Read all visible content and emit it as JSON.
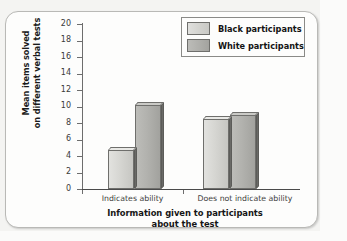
{
  "chart_data": {
    "type": "bar",
    "title": "",
    "xlabel": "Information given to participants about the test",
    "xlabel_lines": [
      "Information given to participants",
      "about the test"
    ],
    "ylabel": "Mean items solved on different verbal tests",
    "ylabel_lines": [
      "Mean items solved",
      "on different verbal tests"
    ],
    "categories": [
      "Indicates ability",
      "Does not indicate ability"
    ],
    "series": [
      {
        "name": "Black participants",
        "values": [
          5.1,
          8.8
        ],
        "color": "#d6d6d2"
      },
      {
        "name": "White participants",
        "values": [
          10.6,
          9.3
        ],
        "color": "#b2b2ae"
      }
    ],
    "ylim": [
      0,
      20
    ],
    "yticks": [
      20,
      18,
      16,
      14,
      12,
      10,
      8,
      6,
      4,
      2,
      0
    ],
    "ytick_labels": [
      "20",
      "18",
      "16",
      "14",
      "12",
      "10",
      "8",
      "6",
      "4",
      "2",
      "0"
    ],
    "grid": false,
    "legend_position": "top-right",
    "legend_entries": [
      "Black participants",
      "White participants"
    ]
  }
}
